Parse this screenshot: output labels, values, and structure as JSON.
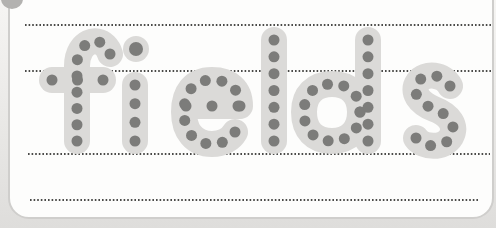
{
  "colors": {
    "page_bg_top": "#f6f5f3",
    "page_bg_bottom": "#dedddb",
    "card_fill": "#fdfdfc",
    "card_border": "#cfcecc",
    "letter_fill": "#dbdad8",
    "trace_dot": "#7c7c7a",
    "guide_dot": "#4a4a48",
    "corner_blob": "#b3b2b0"
  },
  "worksheet": {
    "word": "fields",
    "dot_spacing": 17,
    "dot_radius": 5.5,
    "letter_stroke_width": 26,
    "card": {
      "x": 9,
      "y": -28,
      "width": 484,
      "height": 246,
      "radius": 20
    },
    "corner_blob": {
      "cx": 12,
      "cy": -1,
      "rx": 11,
      "ry": 10
    },
    "guide_lines": [
      {
        "name": "ascender-guide-line",
        "y": 25,
        "x1": 25,
        "x2": 491
      },
      {
        "name": "x-height-guide-line",
        "y": 71,
        "x1": 25,
        "x2": 491
      },
      {
        "name": "baseline-guide-line",
        "y": 154,
        "x1": 28,
        "x2": 490
      },
      {
        "name": "descender-guide-line",
        "y": 200,
        "x1": 30,
        "x2": 478
      }
    ],
    "letters": [
      {
        "char": "f",
        "strokes": [
          {
            "d": "M110 54 C106 40 90 36 81 50 C78 55 77 59 77 66 L77 141"
          },
          {
            "d": "M52 80 L103 80",
            "spacing": 26
          }
        ]
      },
      {
        "char": "i",
        "strokes": [
          {
            "d": "M136 49 L136 49.01",
            "dot_r": 7
          },
          {
            "d": "M135 85 L135 141"
          }
        ]
      },
      {
        "char": "e",
        "strokes": [
          {
            "d": "M240 106 C240 89 229 80 212 80 C193 80 184 93 184 112 C184 131 194 144 212 144 C223 144 231 139 235 132"
          },
          {
            "d": "M186 106 L238 106",
            "spacing": 26
          }
        ]
      },
      {
        "char": "l",
        "strokes": [
          {
            "d": "M274 40 L274 141"
          }
        ]
      },
      {
        "char": "d",
        "strokes": [
          {
            "d": "M360 112 C360 94 349 84 332 84 C314 84 304 95 304 112 C304 130 314 141 332 141 C349 141 360 130 360 112"
          },
          {
            "d": "M368 40 L368 141"
          }
        ]
      },
      {
        "char": "s",
        "strokes": [
          {
            "d": "M450 86 C444 74 425 72 418 82 C411 92 419 103 434 109 C450 115 457 126 451 137 C444 149 423 148 416 138"
          }
        ]
      }
    ]
  }
}
